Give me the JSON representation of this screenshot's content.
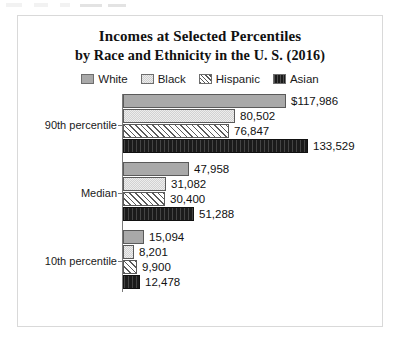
{
  "chart_data": {
    "type": "bar",
    "orientation": "horizontal",
    "title": "Incomes at Selected Percentiles",
    "subtitle": "by Race and Ethnicity in the U. S. (2016)",
    "xlabel": "",
    "ylabel": "",
    "grid": false,
    "legend_position": "top",
    "categories": [
      "90th percentile",
      "Median",
      "10th percentile"
    ],
    "series": [
      {
        "name": "White",
        "values": [
          117986,
          47958,
          15094
        ],
        "labels": [
          "$117,986",
          "47,958",
          "15,094"
        ],
        "color": "#a9a9a9"
      },
      {
        "name": "Black",
        "values": [
          80502,
          31082,
          8201
        ],
        "labels": [
          "80,502",
          "31,082",
          "8,201"
        ],
        "color": "#ededed"
      },
      {
        "name": "Hispanic",
        "values": [
          76847,
          30400,
          9900
        ],
        "labels": [
          "76,847",
          "30,400",
          "9,900"
        ],
        "color": "#ffffff"
      },
      {
        "name": "Asian",
        "values": [
          133529,
          51288,
          12478
        ],
        "labels": [
          "133,529",
          "51,288",
          "12,478"
        ],
        "color": "#1b1b1b"
      }
    ],
    "xlim": [
      0,
      133529
    ],
    "max_value": 133529
  },
  "chart": {
    "title": "Incomes at Selected Percentiles",
    "subtitle": "by Race and Ethnicity in the U. S. (2016)",
    "legend": [
      {
        "label": "White",
        "swatch": "legend-swatch-white"
      },
      {
        "label": "Black",
        "swatch": "legend-swatch-black"
      },
      {
        "label": "Hispanic",
        "swatch": "legend-swatch-hispanic"
      },
      {
        "label": "Asian",
        "swatch": "legend-swatch-asian"
      }
    ],
    "groups": [
      {
        "category": "90th percentile",
        "bars": [
          {
            "series": "White",
            "value": 117986,
            "label": "$117,986"
          },
          {
            "series": "Black",
            "value": 80502,
            "label": "80,502"
          },
          {
            "series": "Hispanic",
            "value": 76847,
            "label": "76,847"
          },
          {
            "series": "Asian",
            "value": 133529,
            "label": "133,529"
          }
        ]
      },
      {
        "category": "Median",
        "bars": [
          {
            "series": "White",
            "value": 47958,
            "label": "47,958"
          },
          {
            "series": "Black",
            "value": 31082,
            "label": "31,082"
          },
          {
            "series": "Hispanic",
            "value": 30400,
            "label": "30,400"
          },
          {
            "series": "Asian",
            "value": 51288,
            "label": "51,288"
          }
        ]
      },
      {
        "category": "10th percentile",
        "bars": [
          {
            "series": "White",
            "value": 15094,
            "label": "15,094"
          },
          {
            "series": "Black",
            "value": 8201,
            "label": "8,201"
          },
          {
            "series": "Hispanic",
            "value": 9900,
            "label": "9,900"
          },
          {
            "series": "Asian",
            "value": 12478,
            "label": "12,478"
          }
        ]
      }
    ]
  }
}
